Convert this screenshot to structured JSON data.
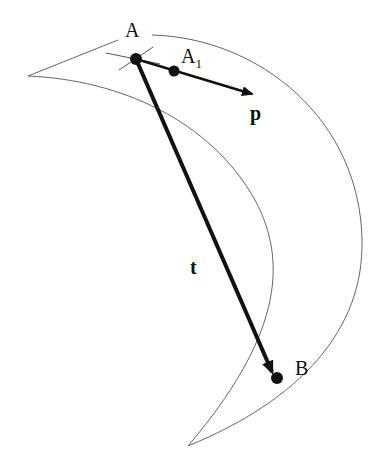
{
  "diagram": {
    "type": "geometric-vector-diagram",
    "labels": {
      "point_a": "A",
      "point_a1": "A",
      "point_a1_sub": "1",
      "point_b": "B",
      "vector_p": "p",
      "vector_t": "t"
    },
    "colors": {
      "stroke": "#111111",
      "outline": "#555555",
      "background": "#ffffff"
    },
    "shapes": {
      "crescent_region": "curved crescent-shaped region with thin outline",
      "tangent_line_at_a": "short thin line tangent at A",
      "vector_p": "arrow from A through A1 pointing right-down",
      "vector_t": "thick arrow from A to B"
    }
  }
}
